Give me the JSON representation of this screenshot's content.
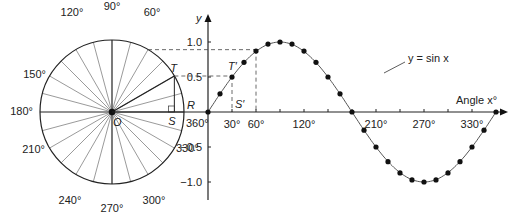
{
  "circle": {
    "center_label": "O",
    "angle_labels": [
      {
        "deg": 60,
        "text": "60°"
      },
      {
        "deg": 90,
        "text": "90°"
      },
      {
        "deg": 120,
        "text": "120°"
      },
      {
        "deg": 150,
        "text": "150°"
      },
      {
        "deg": 180,
        "text": "180°"
      },
      {
        "deg": 210,
        "text": "210°"
      },
      {
        "deg": 240,
        "text": "240°"
      },
      {
        "deg": 270,
        "text": "270°"
      },
      {
        "deg": 300,
        "text": "300°"
      },
      {
        "deg": 330,
        "text": "330°"
      },
      {
        "deg": 360,
        "text": "360°"
      }
    ],
    "point_T": "T",
    "point_S": "S",
    "point_R": "R",
    "spoke_step_deg": 15
  },
  "graph": {
    "y_axis_label": "y",
    "x_axis_label": "Angle x°",
    "y_ticks": [
      {
        "value": 1.0,
        "text": "1.0"
      },
      {
        "value": 0.5,
        "text": "0.5"
      },
      {
        "value": -0.5,
        "text": "−0.5"
      },
      {
        "value": -1.0,
        "text": "−1.0"
      }
    ],
    "x_ticks": [
      {
        "value": 30,
        "text": "30°"
      },
      {
        "value": 60,
        "text": "60°"
      },
      {
        "value": 120,
        "text": "120°"
      },
      {
        "value": 210,
        "text": "210°"
      },
      {
        "value": 270,
        "text": "270°"
      },
      {
        "value": 330,
        "text": "330°"
      }
    ],
    "point_T_prime": "T′",
    "point_S_prime": "S′",
    "curve_label": "y = sin x"
  },
  "chart_data": {
    "type": "line",
    "title": "",
    "xlabel": "Angle x°",
    "ylabel": "y",
    "series": [
      {
        "name": "y = sin x",
        "x": [
          0,
          15,
          30,
          45,
          60,
          75,
          90,
          105,
          120,
          135,
          150,
          165,
          180,
          195,
          210,
          225,
          240,
          255,
          270,
          285,
          300,
          315,
          330,
          345,
          360
        ],
        "values": [
          0,
          0.26,
          0.5,
          0.71,
          0.87,
          0.97,
          1.0,
          0.97,
          0.87,
          0.71,
          0.5,
          0.26,
          0,
          -0.26,
          -0.5,
          -0.71,
          -0.87,
          -0.97,
          -1.0,
          -0.97,
          -0.87,
          -0.71,
          -0.5,
          -0.26,
          0
        ]
      }
    ],
    "xlim": [
      0,
      360
    ],
    "ylim": [
      -1.2,
      1.2
    ],
    "grid": false
  }
}
